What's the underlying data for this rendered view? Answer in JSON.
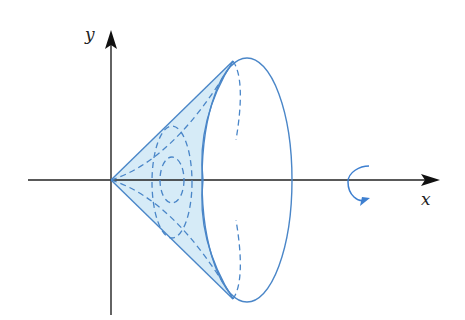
{
  "diagram": {
    "type": "solid-of-revolution",
    "axes": {
      "x_label": "x",
      "y_label": "y"
    },
    "rotation_indicator": {
      "axis": "x",
      "icon": "rotate-arrow-icon"
    },
    "colors": {
      "axis": "#222222",
      "outline": "#4a86c8",
      "fill": "#d6ebf7",
      "arrow": "#3d7fd0"
    }
  }
}
